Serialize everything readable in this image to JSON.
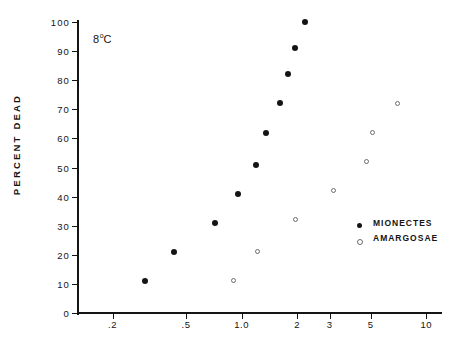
{
  "chart_data": {
    "type": "scatter",
    "title": "",
    "annotation": "8°C",
    "annotation_value": "8",
    "annotation_unit": "°C",
    "xlabel": "",
    "ylabel": "PERCENT DEAD",
    "xscale": "log",
    "yscale": "linear",
    "xlim": [
      0.13,
      12
    ],
    "ylim": [
      0,
      100
    ],
    "grid": false,
    "legend_position": "middle-right",
    "x_ticks": [
      0.2,
      0.5,
      1.0,
      2,
      3,
      5,
      10
    ],
    "x_tick_labels": [
      ".2",
      ".5",
      "1.0",
      "2",
      "3",
      "5",
      "10"
    ],
    "y_ticks": [
      0,
      10,
      20,
      30,
      40,
      50,
      60,
      70,
      80,
      90,
      100
    ],
    "y_tick_labels": [
      "0",
      "10",
      "20",
      "30",
      "40",
      "50",
      "60",
      "70",
      "80",
      "90",
      "100"
    ],
    "series": [
      {
        "name": "MIONECTES",
        "marker": "filled-circle",
        "color": "#141414",
        "points": [
          {
            "x": 0.3,
            "y": 11
          },
          {
            "x": 0.43,
            "y": 21
          },
          {
            "x": 0.72,
            "y": 31
          },
          {
            "x": 0.95,
            "y": 41
          },
          {
            "x": 1.2,
            "y": 51
          },
          {
            "x": 1.35,
            "y": 62
          },
          {
            "x": 1.62,
            "y": 72
          },
          {
            "x": 1.78,
            "y": 82
          },
          {
            "x": 1.95,
            "y": 91
          },
          {
            "x": 2.2,
            "y": 100
          }
        ]
      },
      {
        "name": "AMARGOSAE",
        "marker": "open-circle",
        "color": "#6d6d6d",
        "points": [
          {
            "x": 0.9,
            "y": 11
          },
          {
            "x": 1.22,
            "y": 21
          },
          {
            "x": 1.95,
            "y": 32
          },
          {
            "x": 3.15,
            "y": 42
          },
          {
            "x": 4.75,
            "y": 52
          },
          {
            "x": 5.1,
            "y": 62
          },
          {
            "x": 7.0,
            "y": 72
          }
        ]
      }
    ]
  },
  "legend": {
    "entries": [
      {
        "label": "MIONECTES",
        "marker": "filled-circle"
      },
      {
        "label": "AMARGOSAE",
        "marker": "open-circle"
      }
    ]
  },
  "axis_titles": {
    "y": "PERCENT DEAD",
    "x": ""
  }
}
